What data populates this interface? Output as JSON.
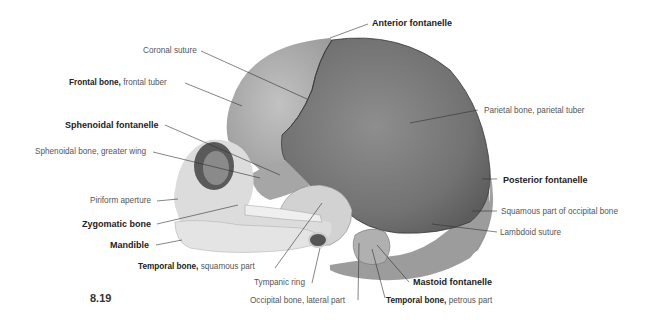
{
  "figure": {
    "number": "8.19"
  },
  "labels": {
    "anterior_fontanelle": "Anterior fontanelle",
    "coronal_suture": "Coronal suture",
    "frontal_bone_bold": "Frontal bone,",
    "frontal_bone_rest": " frontal tuber",
    "parietal_bone": "Parietal bone, parietal tuber",
    "sphenoidal_fontanelle": "Sphenoidal fontanelle",
    "sphenoidal_bone": "Sphenoidal bone, greater wing",
    "posterior_fontanelle": "Posterior fontanelle",
    "piriform_aperture": "Piriform aperture",
    "squamous_occipital": "Squamous part of occipital bone",
    "zygomatic_bone": "Zygomatic bone",
    "lambdoid_suture": "Lambdoid suture",
    "mandible": "Mandible",
    "temporal_squamous_bold": "Temporal bone,",
    "temporal_squamous_rest": " squamous part",
    "mastoid_fontanelle": "Mastoid fontanelle",
    "tympanic_ring": "Tympanic ring",
    "occipital_lateral": "Occipital bone, lateral part",
    "temporal_petrous_bold": "Temporal bone,",
    "temporal_petrous_rest": " petrous part"
  },
  "colors": {
    "parietal": "#7a7a7a",
    "frontal": "#b4b4b4",
    "face": "#dcdcdc",
    "leader_line": "#333333",
    "label_text": "#555555",
    "label_bold": "#222222"
  }
}
